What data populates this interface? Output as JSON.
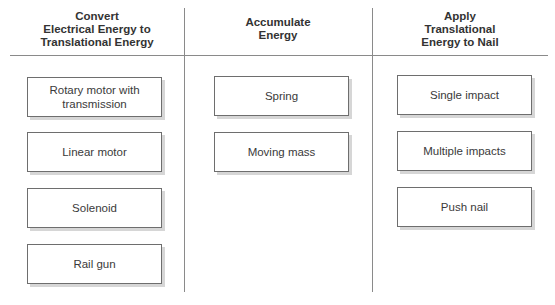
{
  "diagram": {
    "columns": [
      {
        "header": "Convert\nElectrical Energy to\nTranslational Energy",
        "header_lines": [
          "Convert",
          "Electrical Energy to",
          "Translational Energy"
        ],
        "boxes": [
          "Rotary motor with transmission",
          "Linear motor",
          "Solenoid",
          "Rail gun"
        ]
      },
      {
        "header_lines": [
          "Accumulate",
          "Energy"
        ],
        "boxes": [
          "Spring",
          "Moving mass"
        ]
      },
      {
        "header_lines": [
          "Apply",
          "Translational",
          "Energy to Nail"
        ],
        "boxes": [
          "Single impact",
          "Multiple impacts",
          "Push nail"
        ]
      }
    ]
  },
  "colors": {
    "line": "#8a8a8a",
    "box_border": "#6e6e6e",
    "box_shadow": "#d6d6d6",
    "text": "#3a3a3a"
  }
}
